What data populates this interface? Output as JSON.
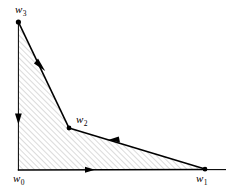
{
  "figure": {
    "type": "polygon-diagram",
    "background_color": "#ffffff",
    "stroke_color": "#000000",
    "hatch_color": "#b4b4b4",
    "hatch_angle_deg": 45,
    "hatch_spacing_px": 4,
    "canvas": {
      "width": 229,
      "height": 196
    }
  },
  "vertices": [
    {
      "id": "w0",
      "label": "w",
      "subscript": "0",
      "x": 18,
      "y": 170,
      "dot": false,
      "label_x": 13,
      "label_y": 173
    },
    {
      "id": "w1",
      "label": "w",
      "subscript": "1",
      "x": 205,
      "y": 169,
      "dot": true,
      "label_x": 196,
      "label_y": 173
    },
    {
      "id": "w2",
      "label": "w",
      "subscript": "2",
      "x": 69,
      "y": 128,
      "dot": true,
      "label_x": 76,
      "label_y": 114
    },
    {
      "id": "w3",
      "label": "w",
      "subscript": "3",
      "x": 18,
      "y": 22,
      "dot": true,
      "label_x": 15,
      "label_y": 4
    }
  ],
  "edges": [
    {
      "id": "edge-w0-w1",
      "from": "w0",
      "to": "w1",
      "direction": "right",
      "arrow_at": [
        90,
        170
      ],
      "weight": 1.4
    },
    {
      "id": "edge-w1-w2",
      "from": "w1",
      "to": "w2",
      "direction": "up-left",
      "arrow_at": [
        113,
        141
      ],
      "weight": 1.6
    },
    {
      "id": "edge-w2-w3",
      "from": "w2",
      "to": "w3",
      "direction": "down-right",
      "arrow_at": [
        41,
        65
      ],
      "weight": 1.6
    },
    {
      "id": "edge-w3-w0",
      "from": "w3",
      "to": "w0",
      "direction": "down",
      "arrow_at": [
        18,
        120
      ],
      "weight": 0.9
    }
  ],
  "axis_lines": {
    "horizontal_extension_to_x": 226,
    "horizontal_y": 170
  },
  "labels": {
    "w0": "w",
    "w1": "w",
    "w2": "w",
    "w3": "w",
    "sub0": "0",
    "sub1": "1",
    "sub2": "2",
    "sub3": "3"
  }
}
